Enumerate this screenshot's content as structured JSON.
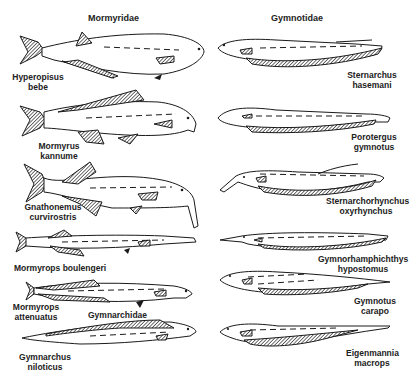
{
  "columns": [
    {
      "family": "Mormyridae"
    },
    {
      "family": "Gymnotidae"
    }
  ],
  "sub_family": "Gymnarchidae",
  "species": [
    {
      "genus": "Hyperopisus",
      "species": "bebe",
      "family": "Mormyridae"
    },
    {
      "genus": "Mormyrus",
      "species": "kannume",
      "family": "Mormyridae"
    },
    {
      "genus": "Gnathonemus",
      "species": "curvirostris",
      "family": "Mormyridae"
    },
    {
      "genus": "Mormyrops",
      "species": "boulengeri",
      "family": "Mormyridae",
      "single_line": "Mormyrops boulengeri"
    },
    {
      "genus": "Mormyrops",
      "species": "attenuatus",
      "family": "Mormyridae"
    },
    {
      "genus": "Gymnarchus",
      "species": "niloticus",
      "family": "Gymnarchidae"
    },
    {
      "genus": "Sternarchus",
      "species": "hasemani",
      "family": "Gymnotidae"
    },
    {
      "genus": "Porotergus",
      "species": "gymnotus",
      "family": "Gymnotidae"
    },
    {
      "genus": "Sternarchorhynchus",
      "species": "oxyrhynchus",
      "family": "Gymnotidae"
    },
    {
      "genus": "Gymnorhamphichthys",
      "species": "hypostomus",
      "family": "Gymnotidae"
    },
    {
      "genus": "Gymnotus",
      "species": "carapo",
      "family": "Gymnotidae"
    },
    {
      "genus": "Eigenmannia",
      "species": "macrops",
      "family": "Gymnotidae"
    }
  ],
  "colors": {
    "ink": "#1a1a1a",
    "background": "#ffffff",
    "hatch": "#444444"
  }
}
